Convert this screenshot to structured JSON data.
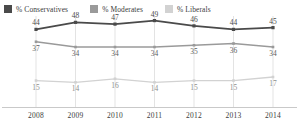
{
  "legend": {
    "items": [
      {
        "label": "% Conservatives",
        "color": "#4a4a4a",
        "key": "conservatives"
      },
      {
        "label": "% Moderates",
        "color": "#9a9a9a",
        "key": "moderates"
      },
      {
        "label": "% Liberals",
        "color": "#d2d2d2",
        "key": "liberals"
      }
    ]
  },
  "chart_data": {
    "type": "line",
    "title": "",
    "subtitle": "",
    "xlabel": "",
    "ylabel": "",
    "categories": [
      "2008",
      "2009",
      "2010",
      "2011",
      "2012",
      "2013",
      "2014"
    ],
    "x": [
      2008,
      2009,
      2010,
      2011,
      2012,
      2013,
      2014
    ],
    "ylim": [
      0,
      55
    ],
    "grid": "vertical",
    "legend_position": "top-left",
    "data_labels": true,
    "series": [
      {
        "name": "% Conservatives",
        "color": "#4a4a4a",
        "values": [
          44,
          48,
          47,
          49,
          46,
          44,
          45
        ]
      },
      {
        "name": "% Moderates",
        "color": "#9a9a9a",
        "values": [
          37,
          34,
          34,
          34,
          35,
          36,
          34
        ]
      },
      {
        "name": "% Liberals",
        "color": "#d2d2d2",
        "values": [
          15,
          14,
          16,
          14,
          15,
          15,
          17
        ]
      }
    ]
  }
}
